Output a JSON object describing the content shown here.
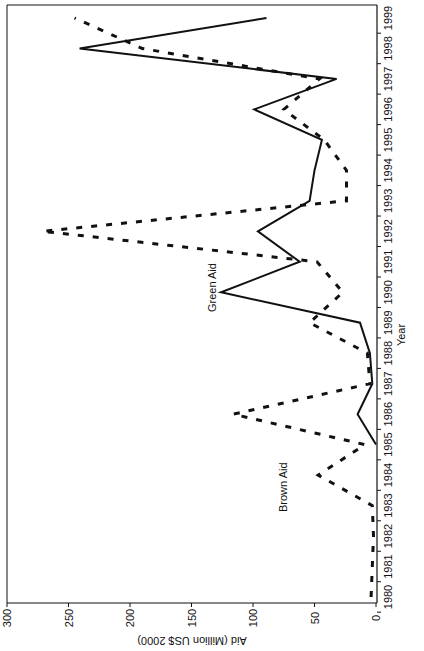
{
  "chart_data": {
    "type": "line",
    "orientation": "rotated-90-ccw",
    "title": "",
    "xlabel": "Year",
    "ylabel": "Aid (Million US$ 2000)",
    "ylim": [
      0,
      300
    ],
    "yticks": [
      0,
      50,
      100,
      150,
      200,
      250,
      300
    ],
    "x": [
      1980,
      1981,
      1982,
      1983,
      1984,
      1985,
      1986,
      1987,
      1988,
      1989,
      1990,
      1991,
      1992,
      1993,
      1994,
      1995,
      1996,
      1997,
      1998,
      1999
    ],
    "grid": false,
    "legend": "inline labels",
    "series": [
      {
        "name": "Green Aid",
        "style": "solid",
        "color": "#111111",
        "label": "Green Aid",
        "values": [
          null,
          null,
          null,
          null,
          null,
          0,
          15,
          3,
          5,
          13,
          126,
          62,
          96,
          54,
          50,
          44,
          99,
          32,
          241,
          89
        ]
      },
      {
        "name": "Brown Aid",
        "style": "dashed",
        "color": "#111111",
        "label": "Brown Aid",
        "values": [
          4,
          3,
          2,
          3,
          47,
          9,
          116,
          5,
          7,
          54,
          27,
          48,
          271,
          24,
          24,
          42,
          75,
          46,
          190,
          245
        ]
      }
    ]
  },
  "labels": {
    "green": "Green Aid",
    "brown": "Brown Aid",
    "xlabel": "Year",
    "ylabel": "Aid (Million US$ 2000)"
  }
}
